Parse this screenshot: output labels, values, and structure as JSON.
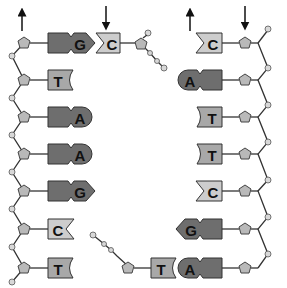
{
  "diagram": {
    "type": "dna-replication",
    "left_strand": {
      "direction_arrow": "up",
      "bases": [
        "G",
        "T",
        "A",
        "A",
        "G",
        "C",
        "T"
      ]
    },
    "left_partner_fragment": {
      "direction_arrow": "down",
      "bases": [
        "C"
      ]
    },
    "right_strand": {
      "direction_arrow": "down",
      "bases": [
        "C",
        "A",
        "T",
        "T",
        "C",
        "G",
        "A"
      ]
    },
    "right_partner_fragment": {
      "direction_arrow": "up",
      "bases": [
        "T"
      ]
    },
    "colors": {
      "purine": "#6e6e6e",
      "thymine": "#a8a8a8",
      "cytosine": "#cdcdcd",
      "backbone": "#333333"
    }
  }
}
